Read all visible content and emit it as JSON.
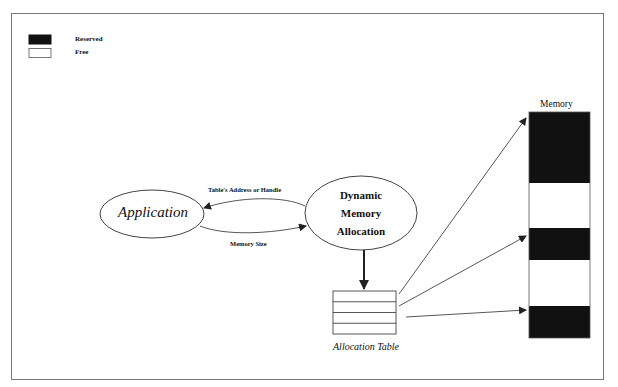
{
  "legend": {
    "items": [
      {
        "label": "Reserved",
        "color": "#111111"
      },
      {
        "label": "Free",
        "color": "#ffffff"
      }
    ]
  },
  "nodes": {
    "application": {
      "label": "Application"
    },
    "dynamic_memory_allocation": {
      "lines": [
        "Dynamic",
        "Memory",
        "Allocation"
      ]
    },
    "allocation_table": {
      "label": "Allocation Table",
      "rows": 4
    },
    "memory": {
      "label": "Memory",
      "blocks": [
        {
          "state": "Reserved"
        },
        {
          "state": "Free"
        },
        {
          "state": "Reserved"
        },
        {
          "state": "Free"
        },
        {
          "state": "Reserved"
        }
      ]
    }
  },
  "edges": {
    "dma_to_app": {
      "label": "Table's Address or Handle"
    },
    "app_to_dma": {
      "label": "Memory Size"
    }
  }
}
